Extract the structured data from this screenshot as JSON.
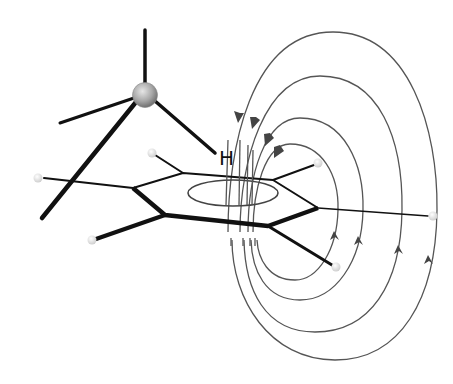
{
  "diagram": {
    "labels": {
      "hydrogen": "H"
    },
    "colors": {
      "bond": "#111111",
      "field_line": "#555555",
      "metal_atom": "#a8a8a8",
      "hydrogen_atom": "#e6e6e6",
      "background": "#ffffff"
    },
    "metal_center": {
      "x": 145,
      "y": 95,
      "r": 12
    },
    "metal_bonds": [
      {
        "name": "bond-up",
        "x1": 145,
        "y1": 30,
        "x2": 145,
        "y2": 83
      },
      {
        "name": "bond-left",
        "x1": 134,
        "y1": 98,
        "x2": 60,
        "y2": 123
      },
      {
        "name": "bond-down-left",
        "x1": 136,
        "y1": 102,
        "x2": 42,
        "y2": 218
      },
      {
        "name": "bond-to-h",
        "x1": 155,
        "y1": 100,
        "x2": 215,
        "y2": 153
      }
    ],
    "benzene": {
      "vertices": [
        [
          133,
          188
        ],
        [
          183,
          173
        ],
        [
          273,
          180
        ],
        [
          318,
          208
        ],
        [
          268,
          226
        ],
        [
          165,
          215
        ]
      ],
      "ring_current_ellipse": {
        "cx": 233,
        "cy": 193,
        "rx": 45,
        "ry": 13
      }
    },
    "substituents": [
      {
        "from": [
          183,
          173
        ],
        "to": [
          152,
          153
        ]
      },
      {
        "from": [
          133,
          188
        ],
        "to": [
          38,
          178
        ]
      },
      {
        "from": [
          165,
          215
        ],
        "to": [
          92,
          240
        ]
      },
      {
        "from": [
          273,
          180
        ],
        "to": [
          318,
          163
        ]
      },
      {
        "from": [
          268,
          226
        ],
        "to": [
          336,
          267
        ]
      },
      {
        "from": [
          318,
          208
        ],
        "to": [
          433,
          216
        ]
      }
    ],
    "hydrogen_atoms": [
      {
        "x": 152,
        "y": 153
      },
      {
        "x": 38,
        "y": 178
      },
      {
        "x": 92,
        "y": 240
      },
      {
        "x": 318,
        "y": 163
      },
      {
        "x": 336,
        "y": 267
      },
      {
        "x": 433,
        "y": 216
      }
    ],
    "field_lines_count": 4,
    "arrow_direction": "clockwise (down on inner side, up on outer side)"
  }
}
